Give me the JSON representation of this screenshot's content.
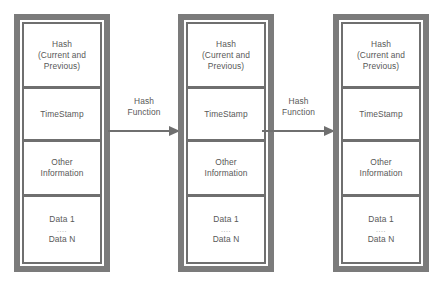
{
  "diagram": {
    "colors": {
      "frame": "#7b7b7b",
      "frame_inner": "#6f6f6f",
      "cell_background": "#ffffff",
      "text": "#585858",
      "arrow": "#6f6f6f",
      "page_background": "#ffffff"
    },
    "blocks": [
      {
        "name": "block-1",
        "cells": [
          {
            "name": "hash-cell",
            "lines": [
              "Hash",
              "(Current and",
              "Previous)"
            ]
          },
          {
            "name": "timestamp-cell",
            "lines": [
              "TimeStamp"
            ]
          },
          {
            "name": "other-information-cell",
            "lines": [
              "Other",
              "Information"
            ]
          },
          {
            "name": "data-cell",
            "lines": [
              "Data 1",
              "....",
              "Data N"
            ]
          }
        ]
      },
      {
        "name": "block-2",
        "cells": [
          {
            "name": "hash-cell",
            "lines": [
              "Hash",
              "(Current and",
              "Previous)"
            ]
          },
          {
            "name": "timestamp-cell",
            "lines": [
              "TimeStamp"
            ]
          },
          {
            "name": "other-information-cell",
            "lines": [
              "Other",
              "Information"
            ]
          },
          {
            "name": "data-cell",
            "lines": [
              "Data 1",
              "....",
              "Data N"
            ]
          }
        ]
      },
      {
        "name": "block-3",
        "cells": [
          {
            "name": "hash-cell",
            "lines": [
              "Hash",
              "(Current and",
              "Previous)"
            ]
          },
          {
            "name": "timestamp-cell",
            "lines": [
              "TimeStamp"
            ]
          },
          {
            "name": "other-information-cell",
            "lines": [
              "Other",
              "Information"
            ]
          },
          {
            "name": "data-cell",
            "lines": [
              "Data 1",
              "....",
              "Data N"
            ]
          }
        ]
      }
    ],
    "connectors": [
      {
        "name": "connector-1",
        "label_lines": [
          "Hash",
          "Function"
        ],
        "direction": "right"
      },
      {
        "name": "connector-2",
        "label_lines": [
          "Hash",
          "Function"
        ],
        "direction": "right"
      }
    ]
  }
}
